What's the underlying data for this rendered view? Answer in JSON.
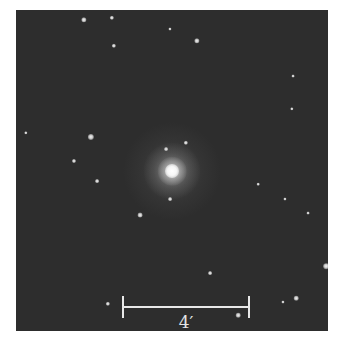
{
  "image": {
    "description": "Grayscale astronomical image of an elliptical galaxy with foreground stars",
    "background_color": "#2d2d2d",
    "frame": {
      "left": 16,
      "top": 10,
      "width": 312,
      "height": 321
    }
  },
  "galaxy": {
    "center_x": 172,
    "center_y": 171,
    "core_color": "#ffffff",
    "halo_radius": 38
  },
  "stars": [
    {
      "x": 84,
      "y": 20,
      "r": 2.2
    },
    {
      "x": 112,
      "y": 18,
      "r": 1.8
    },
    {
      "x": 170,
      "y": 29,
      "r": 1.3
    },
    {
      "x": 114,
      "y": 46,
      "r": 1.8
    },
    {
      "x": 197,
      "y": 41,
      "r": 2.2
    },
    {
      "x": 293,
      "y": 76,
      "r": 1.2
    },
    {
      "x": 292,
      "y": 109,
      "r": 1.4
    },
    {
      "x": 26,
      "y": 133,
      "r": 1.4
    },
    {
      "x": 91,
      "y": 137,
      "r": 2.6
    },
    {
      "x": 186,
      "y": 143,
      "r": 1.8
    },
    {
      "x": 166,
      "y": 149,
      "r": 1.6
    },
    {
      "x": 74,
      "y": 161,
      "r": 1.7
    },
    {
      "x": 97,
      "y": 181,
      "r": 1.6
    },
    {
      "x": 170,
      "y": 199,
      "r": 1.6
    },
    {
      "x": 285,
      "y": 199,
      "r": 1.3
    },
    {
      "x": 258,
      "y": 184,
      "r": 1.1
    },
    {
      "x": 140,
      "y": 215,
      "r": 2.0
    },
    {
      "x": 308,
      "y": 213,
      "r": 1.2
    },
    {
      "x": 326,
      "y": 266,
      "r": 2.4
    },
    {
      "x": 210,
      "y": 273,
      "r": 1.6
    },
    {
      "x": 108,
      "y": 304,
      "r": 1.8
    },
    {
      "x": 296,
      "y": 298,
      "r": 1.9
    },
    {
      "x": 283,
      "y": 302,
      "r": 1.3
    },
    {
      "x": 238,
      "y": 315,
      "r": 1.9
    }
  ],
  "scale_bar": {
    "label": "4′",
    "x_start": 123,
    "x_end": 249,
    "y": 307,
    "tick_height": 22,
    "label_x": 186,
    "label_y": 314,
    "color": "#e8e8e8"
  }
}
